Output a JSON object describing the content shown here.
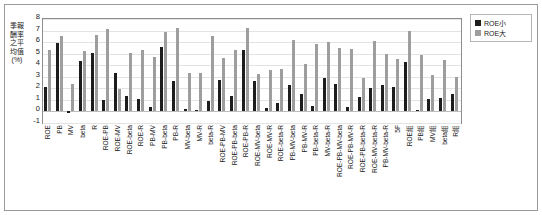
{
  "chart_data": {
    "type": "bar",
    "title": "",
    "xlabel": "",
    "ylabel": "季報酬率之平均值(%)",
    "ylim": [
      -1,
      8
    ],
    "yticks": [
      8,
      7,
      6,
      5,
      4,
      3,
      2,
      1,
      0,
      -1
    ],
    "grid": true,
    "legend_position": "right",
    "legend": [
      "ROE小",
      "ROE大"
    ],
    "categories": [
      "ROE",
      "PB",
      "MV",
      "beta",
      "R",
      "ROE-PB",
      "ROE-MV",
      "ROE-beta",
      "ROE-R",
      "PB-MV",
      "PB-beta",
      "PB-R",
      "MV-beta",
      "MV-R",
      "beta-R",
      "ROE-PB-MV",
      "ROE-PB-beta",
      "ROE-PB-R",
      "ROE-MV-beta",
      "ROE-MV-R",
      "ROE-beta-R",
      "PB-MV-beta",
      "PB-MV-R",
      "PB-beta-R",
      "MV-beta-R",
      "ROE-PB-MV-beta",
      "ROE-PB-MV-R",
      "ROE-PB-beta-R",
      "ROE-MV-beta-R",
      "PB-MV-beta-R",
      "5F",
      "ROE組",
      "PB組",
      "MV組",
      "beta組",
      "R組"
    ],
    "series": [
      {
        "name": "ROE小",
        "color": "#1d1d1d",
        "values": [
          2.1,
          5.9,
          -0.15,
          4.4,
          5.1,
          1.0,
          3.3,
          1.3,
          1.1,
          0.35,
          5.55,
          2.6,
          0.2,
          0.15,
          0.9,
          2.7,
          1.3,
          5.3,
          2.65,
          0.3,
          0.75,
          2.3,
          1.5,
          0.5,
          2.9,
          2.35,
          0.4,
          1.25,
          2.05,
          2.25,
          2.1,
          4.3,
          0.15,
          1.1,
          1.2,
          1.55
        ]
      },
      {
        "name": "ROE大",
        "color": "#9e9e9e",
        "values": [
          5.35,
          6.5,
          2.35,
          5.2,
          6.65,
          7.1,
          1.95,
          5.1,
          5.3,
          4.75,
          6.9,
          7.2,
          3.35,
          3.35,
          6.5,
          4.6,
          5.3,
          7.2,
          3.2,
          3.6,
          3.7,
          6.2,
          4.1,
          5.8,
          6.0,
          5.5,
          5.4,
          2.9,
          6.1,
          4.95,
          4.55,
          6.95,
          4.9,
          3.15,
          4.45,
          3.0
        ]
      }
    ]
  }
}
